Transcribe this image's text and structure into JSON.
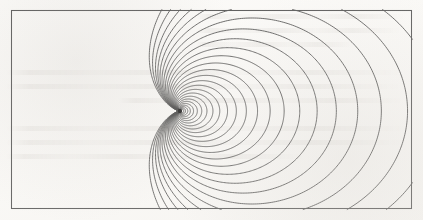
{
  "figure": {
    "kind": "contour-plot",
    "title": "",
    "caption": "",
    "background_color": "#fcfbf9",
    "line_color": "#4a4a4a",
    "frame_color": "#5a5a5a",
    "singularity_color": "#222222",
    "line_width": 0.85,
    "frame_line_width": 1.05
  },
  "frame": {
    "x": 11,
    "y": 10,
    "width": 401,
    "height": 199
  },
  "chart_data": {
    "type": "line",
    "title": "",
    "subtitle": "",
    "xlabel": "",
    "ylabel": "",
    "grid": false,
    "legend": "none",
    "axis_labels_visible": false,
    "tick_labels_visible": false,
    "xlim": [
      11,
      412
    ],
    "ylim": [
      10,
      209
    ],
    "singularity": {
      "x": 180,
      "y": 111,
      "radius": 2.2
    },
    "symmetry_axis_y": 111,
    "contour_count": 26,
    "closed_contour_count": 14,
    "open_contour_count": 12,
    "top_edge_crossings": 19,
    "bottom_edge_crossings": 19,
    "left_edge_crossings": 2,
    "right_edge_crossings": 0,
    "series": [
      {
        "name": "contour-levels",
        "comment": "Each value is a level parameter k used to generate one contour of the dipole family r = k * (1 + cos(theta)) scaled about the singularity; smaller k -> tighter loop near the singular point.",
        "values": [
          3.2,
          5.0,
          7.2,
          9.8,
          13.0,
          16.8,
          21.2,
          26.4,
          32.4,
          39.2,
          47.0,
          55.8,
          65.8,
          77.0,
          89.6,
          103.6,
          119.2,
          136.6,
          155.8,
          177.2,
          200.8,
          227.0,
          256.0,
          288.0,
          323.4,
          362.6
        ]
      }
    ]
  }
}
